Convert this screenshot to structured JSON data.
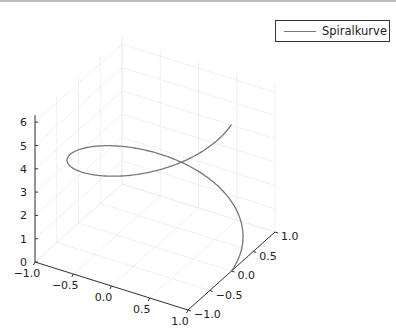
{
  "chart_data": {
    "type": "line",
    "subtype": "3d-line",
    "title": "",
    "xlabel": "",
    "ylabel": "",
    "zlabel": "",
    "series": [
      {
        "name": "Spiralkurve",
        "color": "#777777",
        "parametric": "x=cos(t), y=sin(t), z=t",
        "t_range": [
          0,
          6.2832
        ]
      }
    ],
    "xlim": [
      -1.0,
      1.0
    ],
    "ylim": [
      -1.0,
      1.0
    ],
    "zlim": [
      0,
      6.3
    ],
    "x_ticks": [
      "−1.0",
      "−0.5",
      "0.0",
      "0.5",
      "1.0"
    ],
    "y_ticks": [
      "−1.0",
      "−0.5",
      "0.0",
      "0.5",
      "1.0"
    ],
    "z_ticks": [
      "0",
      "1",
      "2",
      "3",
      "4",
      "5",
      "6"
    ],
    "grid": true,
    "legend_position": "top-right"
  },
  "legend": {
    "label": "Spiralkurve"
  }
}
